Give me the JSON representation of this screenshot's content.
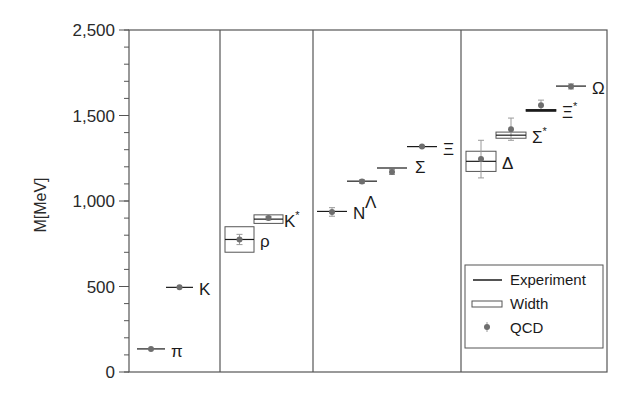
{
  "chart_data": {
    "type": "scatter",
    "title": "",
    "xlabel": "",
    "ylabel": "M[MeV]",
    "ylim": [
      0,
      2000
    ],
    "y_tick_labels": [
      {
        "value": 0,
        "label": "0"
      },
      {
        "value": 500,
        "label": "500"
      },
      {
        "value": 1000,
        "label": "1,000"
      },
      {
        "value": 1500,
        "label": "1,500"
      },
      {
        "value": 2000,
        "label": "2,500"
      }
    ],
    "y_minor_step": 100,
    "grid": false,
    "panels": [
      {
        "name": "pseudoscalar-mesons",
        "particles": [
          {
            "label": "π",
            "sup": "",
            "experiment": 135,
            "width": 0,
            "qcd": 135,
            "qcd_err": 0
          },
          {
            "label": "K",
            "sup": "",
            "experiment": 495,
            "width": 0,
            "qcd": 495,
            "qcd_err": 0
          }
        ]
      },
      {
        "name": "vector-mesons",
        "particles": [
          {
            "label": "ρ",
            "sup": "",
            "experiment": 775,
            "width": 149,
            "qcd": 775,
            "qcd_err": 30
          },
          {
            "label": "K",
            "sup": "*",
            "experiment": 894,
            "width": 50,
            "qcd": 900,
            "qcd_err": 10
          }
        ]
      },
      {
        "name": "octet-baryons",
        "particles": [
          {
            "label": "N",
            "sup": "",
            "experiment": 939,
            "width": 0,
            "qcd": 936,
            "qcd_err": 25
          },
          {
            "label": "Λ",
            "sup": "",
            "experiment": 1116,
            "width": 0,
            "qcd": 1114,
            "qcd_err": 10
          },
          {
            "label": "Σ",
            "sup": "",
            "experiment": 1193,
            "width": 0,
            "qcd": 1170,
            "qcd_err": 15
          },
          {
            "label": "Ξ",
            "sup": "",
            "experiment": 1318,
            "width": 0,
            "qcd": 1318,
            "qcd_err": 5
          }
        ]
      },
      {
        "name": "decuplet-baryons",
        "particles": [
          {
            "label": "Δ",
            "sup": "",
            "experiment": 1232,
            "width": 118,
            "qcd": 1245,
            "qcd_err": 110
          },
          {
            "label": "Σ",
            "sup": "*",
            "experiment": 1385,
            "width": 36,
            "qcd": 1420,
            "qcd_err": 65
          },
          {
            "label": "Ξ",
            "sup": "*",
            "experiment": 1530,
            "width": 9,
            "qcd": 1560,
            "qcd_err": 30
          },
          {
            "label": "Ω",
            "sup": "",
            "experiment": 1672,
            "width": 0,
            "qcd": 1670,
            "qcd_err": 15
          }
        ]
      }
    ],
    "legend": {
      "placement": "bottom-right",
      "entries": [
        {
          "key": "experiment",
          "label": "Experiment"
        },
        {
          "key": "width",
          "label": "Width"
        },
        {
          "key": "qcd",
          "label": "QCD"
        }
      ]
    },
    "colors": {
      "line": "#1a1a1a",
      "frame": "#555555",
      "qcd": "#6e6e6e",
      "err": "#9a9a9a"
    }
  }
}
